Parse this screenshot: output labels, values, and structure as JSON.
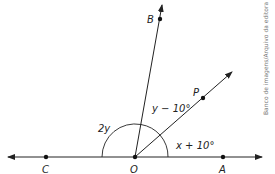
{
  "diagram": {
    "points": {
      "B": "B",
      "P": "P",
      "C": "C",
      "O": "O",
      "A": "A"
    },
    "angles": {
      "angle_COB": "2y",
      "angle_BOP": "y − 10°",
      "angle_POA": "x + 10°"
    },
    "credit": "Banco de imagens/Arquivo da editora"
  }
}
